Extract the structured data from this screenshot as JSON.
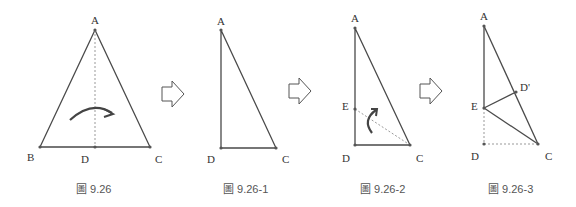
{
  "colors": {
    "line": "#4a4a4a",
    "dashed": "#999999",
    "arrow": "#444444",
    "text": "#333333"
  },
  "figures": [
    {
      "caption": "圖 9.26",
      "labels": {
        "A": "A",
        "B": "B",
        "D": "D",
        "C": "C"
      }
    },
    {
      "caption": "圖 9.26-1",
      "labels": {
        "A": "A",
        "D": "D",
        "C": "C"
      }
    },
    {
      "caption": "圖 9.26-2",
      "labels": {
        "A": "A",
        "E": "E",
        "D": "D",
        "C": "C"
      }
    },
    {
      "caption": "圖 9.26-3",
      "labels": {
        "A": "A",
        "E": "E",
        "Dp": "D'",
        "D": "D",
        "C": "C"
      }
    }
  ],
  "transition_arrows": [
    {
      "id": "arrow-1"
    },
    {
      "id": "arrow-2"
    },
    {
      "id": "arrow-3"
    }
  ]
}
